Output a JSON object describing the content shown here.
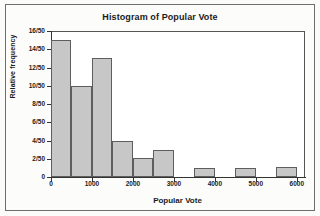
{
  "chart_data": {
    "type": "bar",
    "title": "Histogram of Popular Vote",
    "xlabel": "Popular Vote",
    "ylabel": "Relative frequency",
    "grid": false,
    "legend": false,
    "xlim": [
      0,
      6200
    ],
    "ylim": [
      0,
      16
    ],
    "bin_width": 500,
    "y_unit": "/50",
    "ytick_labels": [
      "0",
      "2/50",
      "4/50",
      "6/50",
      "8/50",
      "10/50",
      "12/50",
      "14/50",
      "16/50"
    ],
    "ytick_values": [
      0,
      2,
      4,
      6,
      8,
      10,
      12,
      14,
      16
    ],
    "xtick_labels": [
      "0",
      "1000",
      "2000",
      "3000",
      "4000",
      "5000",
      "6000"
    ],
    "xtick_values": [
      0,
      1000,
      2000,
      3000,
      4000,
      5000,
      6000
    ],
    "bins": [
      {
        "x0": 0,
        "x1": 500,
        "count": 15,
        "label": "15/50"
      },
      {
        "x0": 500,
        "x1": 1000,
        "count": 10,
        "label": "10/50"
      },
      {
        "x0": 1000,
        "x1": 1500,
        "count": 13,
        "label": "13/50"
      },
      {
        "x0": 1500,
        "x1": 2000,
        "count": 4,
        "label": "4/50"
      },
      {
        "x0": 2000,
        "x1": 2500,
        "count": 2.1,
        "label": "2/50"
      },
      {
        "x0": 2500,
        "x1": 3000,
        "count": 3,
        "label": "3/50"
      },
      {
        "x0": 3000,
        "x1": 3500,
        "count": 0,
        "label": "0"
      },
      {
        "x0": 3500,
        "x1": 4000,
        "count": 1,
        "label": "1/50"
      },
      {
        "x0": 4000,
        "x1": 4500,
        "count": 0,
        "label": "0"
      },
      {
        "x0": 4500,
        "x1": 5000,
        "count": 1,
        "label": "1/50"
      },
      {
        "x0": 5000,
        "x1": 5500,
        "count": 0,
        "label": "0"
      },
      {
        "x0": 5500,
        "x1": 6000,
        "count": 1.1,
        "label": "1/50"
      }
    ],
    "colors": {
      "bar_fill": "#c7c7c7",
      "bar_border": "#5e5e5e",
      "plot_background": "#ffffff",
      "page_background": "#fbfbfa",
      "axis": "#333333",
      "text": "#1b1b1b"
    }
  }
}
